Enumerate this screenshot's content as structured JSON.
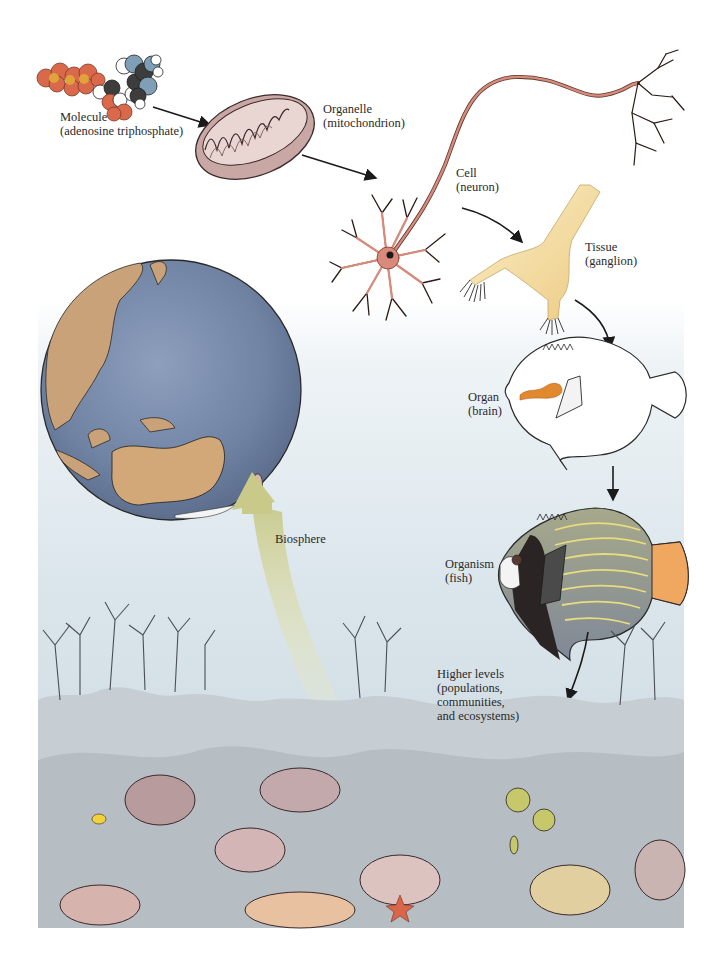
{
  "diagram": {
    "background_color": "#ffffff",
    "arrow_color": "#1a1a1a",
    "biosphere_arrow_color": "#c9c98a",
    "levels": [
      {
        "id": "molecule",
        "name": "Molecule",
        "example": "(adenosine triphosphate)"
      },
      {
        "id": "organelle",
        "name": "Organelle",
        "example": "(mitochondrion)"
      },
      {
        "id": "cell",
        "name": "Cell",
        "example": "(neuron)"
      },
      {
        "id": "tissue",
        "name": "Tissue",
        "example": "(ganglion)"
      },
      {
        "id": "organ",
        "name": "Organ",
        "example": "(brain)"
      },
      {
        "id": "organism",
        "name": "Organism",
        "example": "(fish)"
      },
      {
        "id": "higher",
        "name": "Higher levels",
        "example_lines": [
          "(populations,",
          "communities,",
          "and ecosystems)"
        ]
      },
      {
        "id": "biosphere",
        "name": "Biosphere"
      }
    ],
    "colors": {
      "atp_phosphate": "#d9694a",
      "atp_phosphorus": "#e0a23a",
      "atp_nitrogen": "#7f9fb6",
      "atp_carbon": "#3d3d3d",
      "mitochondrion": "#c9a7a4",
      "neuron": "#d98a7a",
      "ganglion": "#f2dca0",
      "brain": "#e0892e",
      "fish_body": "#8f98a3",
      "fish_stripes": "#e8dc7e",
      "fish_tail": "#f0a860",
      "globe_ocean": "#7d8fae",
      "globe_land": "#c9a27a",
      "reef_water": "#d6e1e7"
    }
  }
}
